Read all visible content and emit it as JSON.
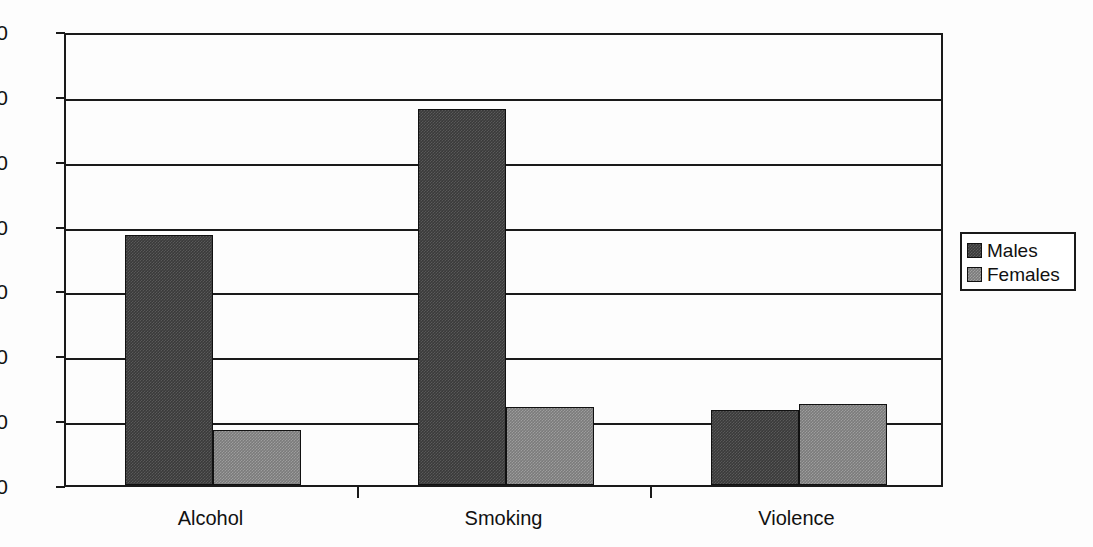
{
  "chart_data": {
    "type": "bar",
    "title": "",
    "subtitle": "",
    "xlabel": "",
    "ylabel": "",
    "categories": [
      "Alcohol",
      "Smoking",
      "Violence"
    ],
    "series": [
      {
        "name": "Males",
        "color": "#3a3a3a",
        "values": [
          38.5,
          58.0,
          11.5
        ]
      },
      {
        "name": "Females",
        "color": "#7b7b7b",
        "values": [
          8.5,
          12.0,
          12.5
        ]
      }
    ],
    "ylim": [
      0,
      70
    ],
    "ytick_values": [
      0,
      10,
      20,
      30,
      40,
      50,
      60,
      70
    ],
    "ytick_labels": [
      "0",
      "10",
      "20",
      "30",
      "40",
      "50",
      "60",
      "70"
    ],
    "grid": true,
    "grid_axis": "y",
    "legend": {
      "position": "right",
      "entries": [
        {
          "label": "Males",
          "color": "#3a3a3a"
        },
        {
          "label": "Females",
          "color": "#7b7b7b"
        }
      ]
    }
  },
  "axis": {
    "y_labels": [
      "70",
      "60",
      "50",
      "40",
      "30",
      "20",
      "10",
      "0"
    ],
    "x_labels": [
      "Alcohol",
      "Smoking",
      "Violence"
    ]
  },
  "legend": {
    "items": [
      {
        "label": "Males"
      },
      {
        "label": "Females"
      }
    ]
  }
}
